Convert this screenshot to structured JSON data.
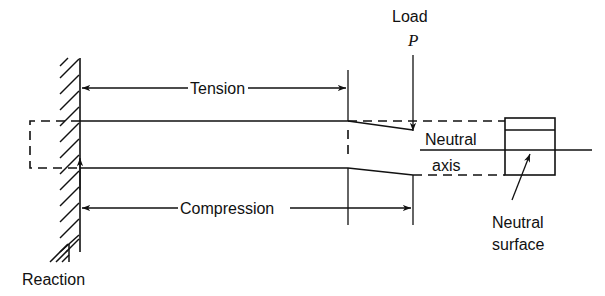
{
  "figure": {
    "colors": {
      "line": "#111111",
      "background": "#ffffff"
    }
  },
  "labels": {
    "tension": "Tension",
    "compression": "Compression",
    "load": "Load",
    "load_symbol": "P",
    "neutral_axis_line1": "Neutral",
    "neutral_axis_line2": "axis",
    "neutral_surface_line1": "Neutral",
    "neutral_surface_line2": "surface",
    "reaction": "Reaction"
  },
  "geometry": {
    "wall": {
      "x1": 60,
      "x2": 80,
      "y1": 58,
      "y2": 252
    },
    "beam": {
      "top_y": 121,
      "bottom_y": 168,
      "fixed_x": 80,
      "taper_start_x": 348,
      "tip_x": 413,
      "tip_top_y": 130,
      "tip_bottom_y": 175
    },
    "undeformed_outline": {
      "x1": 30,
      "x2": 80,
      "y1": 121,
      "y2": 168
    },
    "neutral_axis_y": 150,
    "cross_section_box": {
      "x1": 505,
      "x2": 555,
      "y1": 118,
      "y2": 175,
      "divider_y": 130
    },
    "tension_dimension_y": 88,
    "compression_dimension_y": 208,
    "load_arrow_x": 413
  }
}
